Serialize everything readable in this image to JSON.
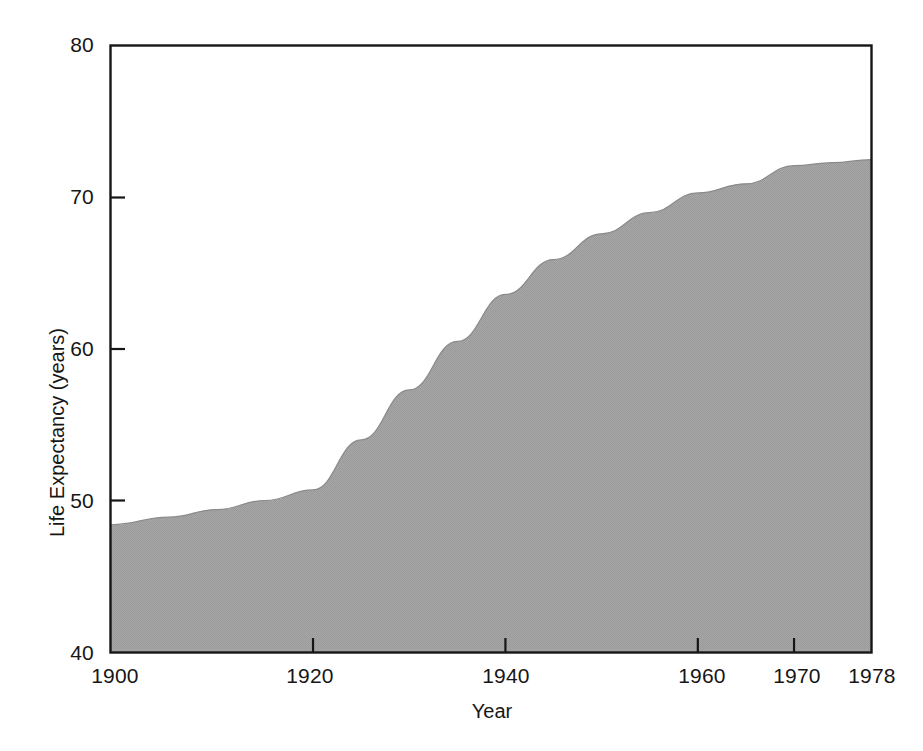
{
  "chart_data": {
    "type": "area",
    "title": "",
    "xlabel": "Year",
    "ylabel": "Life Expectancy (years)",
    "xlim": [
      1899,
      1978
    ],
    "ylim": [
      40,
      80
    ],
    "grid": false,
    "legend": "none",
    "fill_color": "#a3a3a3",
    "axis_color": "#161616",
    "background_color": "#ffffff",
    "x_ticks": [
      1900,
      1920,
      1940,
      1960,
      1970,
      1978
    ],
    "x_tick_labels": [
      "1900",
      "1920",
      "1940",
      "1960",
      "1970",
      "1978"
    ],
    "y_ticks": [
      40,
      50,
      60,
      70,
      80
    ],
    "y_tick_labels": [
      "40",
      "50",
      "60",
      "70",
      "80"
    ],
    "x": [
      1899,
      1905,
      1910,
      1915,
      1920,
      1925,
      1930,
      1935,
      1940,
      1945,
      1950,
      1955,
      1960,
      1965,
      1970,
      1974,
      1978
    ],
    "values": [
      48.4,
      48.9,
      49.4,
      50.0,
      50.7,
      54.0,
      57.3,
      60.5,
      63.6,
      65.9,
      67.6,
      69.0,
      70.3,
      70.9,
      72.1,
      72.3,
      72.5
    ],
    "series": [
      {
        "name": "Life Expectancy",
        "values": [
          48.4,
          48.9,
          49.4,
          50.0,
          50.7,
          54.0,
          57.3,
          60.5,
          63.6,
          65.9,
          67.6,
          69.0,
          70.3,
          70.9,
          72.1,
          72.3,
          72.5
        ]
      }
    ]
  },
  "axes": {
    "y_title": "Life Expectancy (years)",
    "x_title": "Year"
  },
  "y_labels": [
    "80",
    "70",
    "60",
    "50",
    "40"
  ],
  "x_labels": [
    "1900",
    "1920",
    "1940",
    "1960",
    "1970",
    "1978"
  ]
}
